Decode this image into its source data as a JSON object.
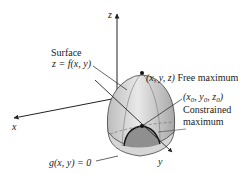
{
  "diagram": {
    "axes": {
      "x_label": "x",
      "y_label": "y",
      "z_label": "z"
    },
    "labels": {
      "surface_line1": "Surface",
      "surface_line2": "z = f(x, y)",
      "free_max_point": "(x, y, z)",
      "free_max_text": "Free maximum",
      "constrained_point": "(x0, y0, z0)",
      "constrained_point_parts": {
        "x": "x",
        "y": "y",
        "z": "z",
        "sub": "0"
      },
      "constrained_text_line1": "Constrained",
      "constrained_text_line2": "maximum",
      "constraint": "g(x, y) = 0"
    },
    "colors": {
      "surface_light": "#e6e6e6",
      "surface_mid": "#bdbdbd",
      "surface_dark": "#8f8f8f",
      "line": "#222222"
    }
  }
}
